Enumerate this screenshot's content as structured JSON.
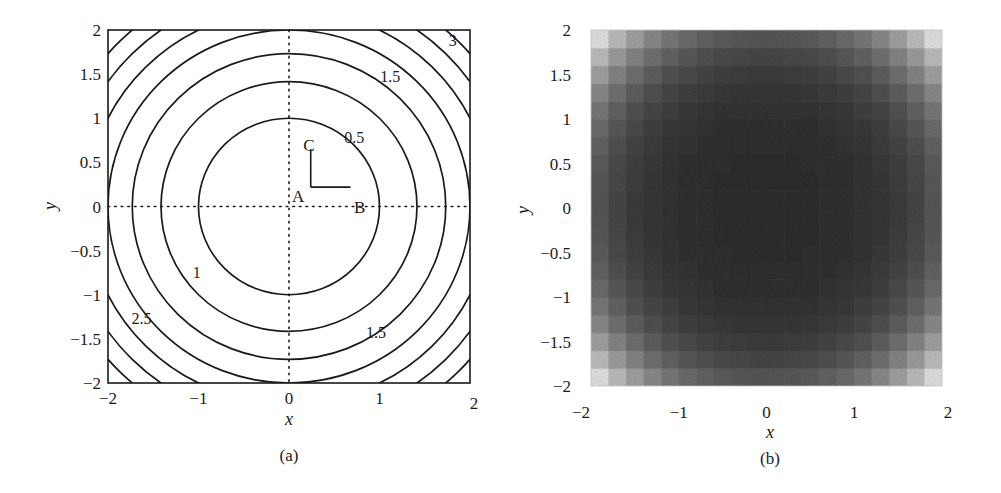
{
  "chart_data": [
    {
      "panel": "a",
      "type": "contour",
      "caption": "(a)",
      "xlabel": "x",
      "ylabel": "y",
      "xlim": [
        -2,
        2
      ],
      "ylim": [
        -2,
        2
      ],
      "xticks": [
        "-2",
        "-1",
        "0",
        "1",
        "2"
      ],
      "xtick_values": [
        -2,
        -1,
        0,
        1,
        2
      ],
      "yticks": [
        "2",
        "1.5",
        "1",
        "0.5",
        "0",
        "-0.5",
        "-1",
        "-1.5",
        "-2"
      ],
      "ytick_values": [
        2,
        1.5,
        1,
        0.5,
        0,
        -0.5,
        -1,
        -1.5,
        -2
      ],
      "function": "f(x,y) = (x^2 + y^2) / 2",
      "contour_levels": [
        0.5,
        1,
        1.5,
        2,
        2.5,
        3,
        3.5
      ],
      "contour_labels": [
        {
          "text": "0.5",
          "x": 0.72,
          "y": 0.78
        },
        {
          "text": "1",
          "x": -1.02,
          "y": -0.75
        },
        {
          "text": "1.5",
          "x": 1.12,
          "y": 1.47
        },
        {
          "text": "1.5",
          "x": 0.96,
          "y": -1.43
        },
        {
          "text": "2.5",
          "x": -1.63,
          "y": -1.28
        },
        {
          "text": "3",
          "x": 1.81,
          "y": 1.88
        }
      ],
      "crosshair": {
        "style": "dotted",
        "x": 0,
        "y": 0
      },
      "points": [
        {
          "label": "A",
          "x": 0.1,
          "y": 0.12
        },
        {
          "label": "B",
          "x": 0.78,
          "y": 0.0
        },
        {
          "label": "C",
          "x": 0.22,
          "y": 0.7
        }
      ],
      "vectors": [
        {
          "from": [
            0.24,
            0.22
          ],
          "to": [
            0.68,
            0.22
          ]
        },
        {
          "from": [
            0.24,
            0.22
          ],
          "to": [
            0.24,
            0.65
          ]
        }
      ],
      "grid": false
    },
    {
      "panel": "b",
      "type": "heatmap",
      "caption": "(b)",
      "xlabel": "x",
      "ylabel": "y",
      "xlim": [
        -2,
        2
      ],
      "ylim": [
        -2,
        2
      ],
      "xticks": [
        "-2",
        "-1",
        "0",
        "1",
        "2"
      ],
      "xtick_values": [
        -2,
        -1,
        0,
        1,
        2
      ],
      "yticks": [
        "2",
        "1.5",
        "1",
        "0.5",
        "0",
        "-0.5",
        "-1",
        "-1.5",
        "-2"
      ],
      "ytick_values": [
        2,
        1.5,
        1,
        0.5,
        0,
        -0.5,
        -1,
        -1.5,
        -2
      ],
      "colormap": "grayscale, dark at center, light at corners",
      "grid_cells": 20,
      "colors": {
        "center": "#333333",
        "corner": "#f4f4f4"
      },
      "grid": false
    }
  ]
}
